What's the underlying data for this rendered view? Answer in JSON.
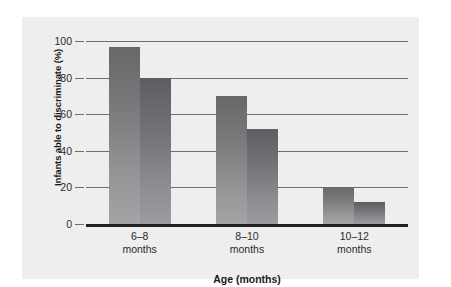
{
  "chart_data": {
    "type": "bar",
    "title": "",
    "xlabel": "Age (months)",
    "ylabel": "Infants able to discriminate (%)",
    "categories": [
      "6–8\nmonths",
      "8–10\nmonths",
      "10–12\nmonths"
    ],
    "category_labels": [
      "6–8",
      "8–10",
      "10–12"
    ],
    "category_unit": "months",
    "series": [
      {
        "name": "series-1",
        "values": [
          97,
          70,
          20
        ]
      },
      {
        "name": "series-2",
        "values": [
          80,
          52,
          12
        ]
      }
    ],
    "ylim": [
      0,
      100
    ],
    "yticks": [
      0,
      20,
      40,
      60,
      80,
      100
    ],
    "ytick_labels": [
      "0",
      "20",
      "40",
      "60",
      "80",
      "100"
    ],
    "grid": true,
    "legend": "none",
    "colors": {
      "panel_background": "#eeeeee",
      "figure_background": "#ffffff",
      "bar_series_1_top": "#67676a",
      "bar_series_1_bottom": "#a4a4a7",
      "bar_series_2_top": "#5e5e62",
      "bar_series_2_bottom": "#9c9ca0",
      "gridline": "#6e6e6e",
      "axis": "#202020",
      "text": "#1a1a1a"
    }
  }
}
